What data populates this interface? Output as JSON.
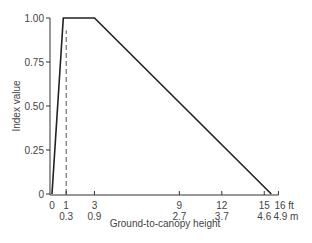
{
  "chart_data": {
    "type": "line",
    "title": "",
    "xlabel": "Ground-to-canopy height",
    "ylabel": "Index value",
    "x_unit_primary": "ft",
    "x_unit_secondary": "m",
    "xlim": [
      0,
      16
    ],
    "ylim": [
      0,
      1.0
    ],
    "grid": false,
    "legend": null,
    "y_ticks": [
      {
        "value": 0,
        "label": "0"
      },
      {
        "value": 0.25,
        "label": "0.25"
      },
      {
        "value": 0.5,
        "label": "0.50"
      },
      {
        "value": 0.75,
        "label": "0.75"
      },
      {
        "value": 1.0,
        "label": "1.00"
      }
    ],
    "x_ticks": [
      {
        "value": 0,
        "ft": "0",
        "m": ""
      },
      {
        "value": 1,
        "ft": "1",
        "m": "0.3"
      },
      {
        "value": 3,
        "ft": "3",
        "m": "0.9"
      },
      {
        "value": 9,
        "ft": "9",
        "m": "2.7"
      },
      {
        "value": 12,
        "ft": "12",
        "m": "3.7"
      },
      {
        "value": 15,
        "ft": "15",
        "m": "4.6"
      },
      {
        "value": 16,
        "ft": "16 ft",
        "m": "4.9 m"
      }
    ],
    "series": [
      {
        "name": "Index value (solid)",
        "style": "solid",
        "x": [
          0,
          0.8,
          3,
          15.5
        ],
        "y": [
          0,
          1.0,
          1.0,
          0
        ]
      },
      {
        "name": "Reference at 1 ft (dashed)",
        "style": "dashed",
        "x": [
          1,
          1
        ],
        "y": [
          0,
          0.93
        ]
      }
    ]
  },
  "labels": {
    "ylabel": "Index value",
    "xlabel": "Ground-to-canopy height"
  },
  "colors": {
    "line": "#222222",
    "axis": "#333333",
    "text": "#444444"
  }
}
